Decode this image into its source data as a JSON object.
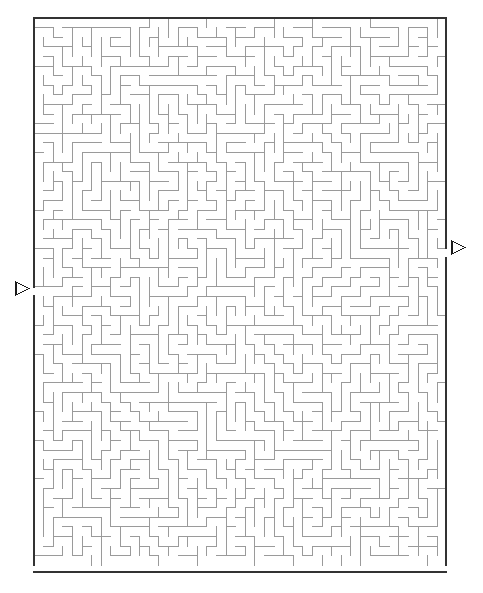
{
  "page": {
    "background_color": "#ffffff",
    "width": 483,
    "height": 593
  },
  "maze": {
    "type": "perfect-maze",
    "columns": 43,
    "rows": 57,
    "cell_size": 9.6,
    "origin_x": 34,
    "origin_y": 18,
    "width_px": 412,
    "height_px": 554,
    "border_color": "#333333",
    "border_width": 2,
    "wall_color": "#9a9a9a",
    "wall_width": 1,
    "background_color": "#ffffff",
    "seed": 20240517
  },
  "entrance": {
    "label": "entrance-arrow",
    "side": "left",
    "row": 28,
    "marker_x": 16,
    "marker_y": 282,
    "marker_size": 13,
    "direction": "right",
    "color": "#1a1a1a"
  },
  "exit": {
    "label": "exit-arrow",
    "side": "right",
    "row": 24,
    "marker_x": 452,
    "marker_y": 241,
    "marker_size": 13,
    "direction": "right",
    "color": "#1a1a1a"
  }
}
